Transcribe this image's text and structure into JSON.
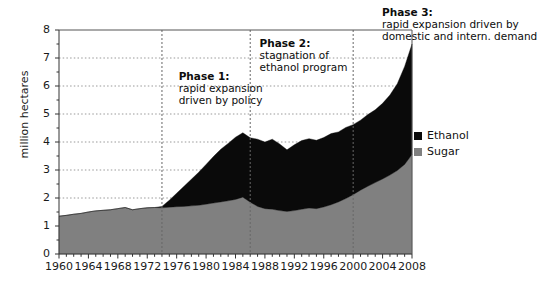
{
  "chart_data": {
    "type": "area",
    "stacked": true,
    "title": "",
    "xlabel": "",
    "ylabel": "million hectares",
    "xlim": [
      1960,
      2008
    ],
    "ylim": [
      0,
      8
    ],
    "ytick_values": [
      0,
      1,
      2,
      3,
      4,
      5,
      6,
      7,
      8
    ],
    "ytick_labels": [
      "0",
      "1",
      "2",
      "3",
      "4",
      "5",
      "6",
      "7",
      "8"
    ],
    "xtick_labels": [
      "1960",
      "1964",
      "1968",
      "1972",
      "1976",
      "1980",
      "1984",
      "1988",
      "1992",
      "1996",
      "2000",
      "2004",
      "2008"
    ],
    "xtick_values": [
      1960,
      1964,
      1968,
      1972,
      1976,
      1980,
      1984,
      1988,
      1992,
      1996,
      2000,
      2004,
      2008
    ],
    "minor_xticks_every": 1,
    "grid": "horizontal-dotted",
    "legend_position": "right",
    "x": [
      1960,
      1961,
      1962,
      1963,
      1964,
      1965,
      1966,
      1967,
      1968,
      1969,
      1970,
      1971,
      1972,
      1973,
      1974,
      1975,
      1976,
      1977,
      1978,
      1979,
      1980,
      1981,
      1982,
      1983,
      1984,
      1985,
      1986,
      1987,
      1988,
      1989,
      1990,
      1991,
      1992,
      1993,
      1994,
      1995,
      1996,
      1997,
      1998,
      1999,
      2000,
      2001,
      2002,
      2003,
      2004,
      2005,
      2006,
      2007,
      2008
    ],
    "series": [
      {
        "name": "Sugar",
        "color": "#808080",
        "values": [
          1.35,
          1.38,
          1.42,
          1.45,
          1.5,
          1.54,
          1.56,
          1.58,
          1.62,
          1.66,
          1.58,
          1.62,
          1.65,
          1.66,
          1.65,
          1.67,
          1.69,
          1.7,
          1.72,
          1.74,
          1.78,
          1.82,
          1.86,
          1.9,
          1.95,
          2.03,
          1.85,
          1.7,
          1.62,
          1.6,
          1.55,
          1.52,
          1.55,
          1.6,
          1.64,
          1.62,
          1.68,
          1.76,
          1.86,
          1.98,
          2.12,
          2.28,
          2.42,
          2.55,
          2.68,
          2.82,
          2.98,
          3.2,
          3.55
        ]
      },
      {
        "name": "Ethanol",
        "color": "#0a0a0a",
        "values": [
          0,
          0,
          0,
          0,
          0,
          0,
          0,
          0,
          0,
          0,
          0,
          0,
          0,
          0,
          0.05,
          0.25,
          0.48,
          0.72,
          0.95,
          1.18,
          1.42,
          1.66,
          1.88,
          2.05,
          2.22,
          2.3,
          2.3,
          2.4,
          2.38,
          2.5,
          2.38,
          2.2,
          2.35,
          2.45,
          2.48,
          2.44,
          2.48,
          2.54,
          2.5,
          2.54,
          2.5,
          2.5,
          2.56,
          2.6,
          2.7,
          2.86,
          3.1,
          3.5,
          3.95
        ]
      }
    ],
    "annotations": [
      {
        "id": "phase1",
        "heading": "Phase 1:",
        "lines": [
          "rapid expansion",
          "driven by policy"
        ]
      },
      {
        "id": "phase2",
        "heading": "Phase 2:",
        "lines": [
          "stagnation of",
          "ethanol program"
        ]
      },
      {
        "id": "phase3",
        "heading": "Phase 3:",
        "lines": [
          "rapid expansion driven by",
          "domestic and intern. demand"
        ]
      }
    ],
    "phase_dividers": [
      1974,
      1986,
      2000
    ]
  },
  "legend": {
    "items": [
      {
        "label": "Ethanol",
        "color": "#0a0a0a"
      },
      {
        "label": "Sugar",
        "color": "#808080"
      }
    ]
  },
  "axis": {
    "ylabel": "million hectares"
  }
}
